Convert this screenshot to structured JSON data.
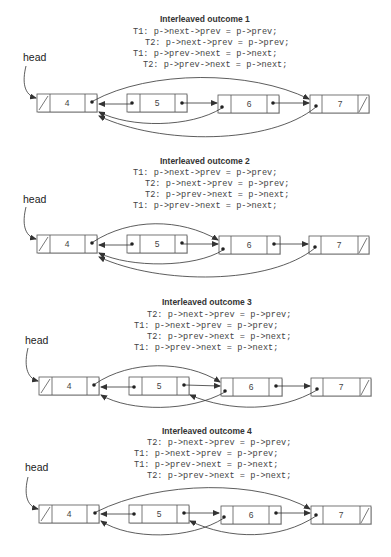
{
  "head_label": "head",
  "outcomes": [
    {
      "title": "Interleaved outcome 1",
      "lines": [
        {
          "text": "T1: p->next->prev = p->prev;",
          "indent": 0
        },
        {
          "text": "T2: p->next->prev = p->prev;",
          "indent": 1
        },
        {
          "text": "T1: p->prev->next = p->next;",
          "indent": 0
        },
        {
          "text": "T2: p->prev->next = p->next;",
          "indent": 1
        }
      ],
      "nodes": [
        "4",
        "5",
        "6",
        "7"
      ]
    },
    {
      "title": "Interleaved outcome 2",
      "lines": [
        {
          "text": "T1: p->next->prev = p->prev;",
          "indent": 0
        },
        {
          "text": "T2: p->next->prev = p->prev;",
          "indent": 1
        },
        {
          "text": "T2: p->prev->next = p->next;",
          "indent": 1
        },
        {
          "text": "T1: p->prev->next = p->next;",
          "indent": 0
        }
      ],
      "nodes": [
        "4",
        "5",
        "6",
        "7"
      ]
    },
    {
      "title": "Interleaved outcome 3",
      "lines": [
        {
          "text": "T2: p->next->prev = p->prev;",
          "indent": 1
        },
        {
          "text": "T1: p->next->prev = p->prev;",
          "indent": 0
        },
        {
          "text": "T2: p->prev->next = p->next;",
          "indent": 1
        },
        {
          "text": "T1: p->prev->next = p->next;",
          "indent": 0
        }
      ],
      "nodes": [
        "4",
        "5",
        "6",
        "7"
      ]
    },
    {
      "title": "Interleaved outcome 4",
      "lines": [
        {
          "text": "T2: p->next->prev = p->prev;",
          "indent": 1
        },
        {
          "text": "T1: p->next->prev = p->prev;",
          "indent": 0
        },
        {
          "text": "T1: p->prev->next = p->next;",
          "indent": 0
        },
        {
          "text": "T2: p->prev->next = p->next;",
          "indent": 1
        }
      ],
      "nodes": [
        "4",
        "5",
        "6",
        "7"
      ]
    }
  ],
  "colors": {
    "line": "#333333",
    "box_border": "#555555",
    "shadow": "#cccccc",
    "text": "#444444"
  }
}
